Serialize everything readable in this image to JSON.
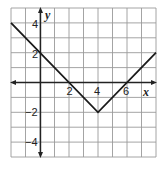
{
  "chart_data": {
    "type": "line",
    "title": "",
    "xlabel": "x",
    "ylabel": "y",
    "xlim": [
      -2,
      8
    ],
    "ylim": [
      -5,
      5
    ],
    "grid": true,
    "x_tick_labels": [
      "2",
      "4",
      "6"
    ],
    "y_tick_labels": [
      "4",
      "2",
      "-2",
      "-4"
    ],
    "series": [
      {
        "name": "y = |x - 4| - 2",
        "points": [
          [
            -2,
            4
          ],
          [
            4,
            -2
          ],
          [
            8,
            2
          ]
        ]
      }
    ],
    "colors": {
      "grid": "#9a9a9a",
      "axis": "#222222",
      "line": "#1a1a1a"
    }
  },
  "labels": {
    "x_axis": "x",
    "y_axis": "y",
    "x2": "2",
    "x4": "4",
    "x6": "6",
    "y4": "4",
    "y2": "2",
    "yneg2": "−2",
    "yneg4": "−4"
  }
}
